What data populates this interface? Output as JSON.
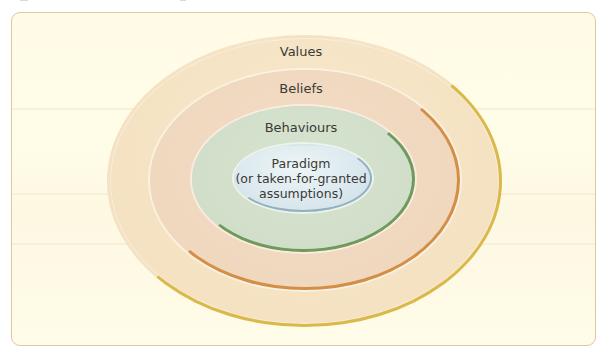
{
  "diagram": {
    "type": "nested-ellipses",
    "layers": [
      {
        "id": "values",
        "label": "Values",
        "fill": "#f4e2c2",
        "stroke": "#d9b94a"
      },
      {
        "id": "beliefs",
        "label": "Beliefs",
        "fill": "#efd6bd",
        "stroke": "#d28f45"
      },
      {
        "id": "behaviours",
        "label": "Behaviours",
        "fill": "#cfdcc6",
        "stroke": "#6f9a5c"
      },
      {
        "id": "paradigm",
        "label_lines": [
          "Paradigm",
          "(or taken-for-granted",
          "assumptions)"
        ],
        "fill": "#d7e6ec",
        "stroke": "#8fb1c2"
      }
    ],
    "panel": {
      "background": "#fffbe6",
      "border": "#dcc9a3"
    }
  }
}
